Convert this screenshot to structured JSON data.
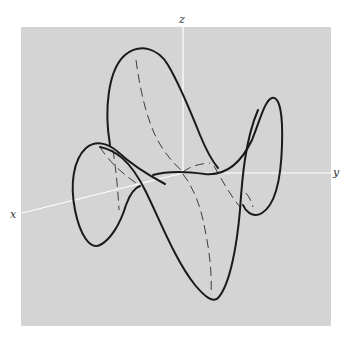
{
  "figure": {
    "type": "3d-curve-plot",
    "background_color": "#d4d4d4",
    "curve_color": "#1a1a1a",
    "axis_color": "#ffffff"
  },
  "axes": {
    "x": {
      "label": "x"
    },
    "y": {
      "label": "y"
    },
    "z": {
      "label": "z"
    }
  }
}
